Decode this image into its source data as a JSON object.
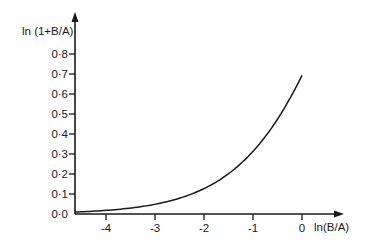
{
  "chart_data": {
    "type": "line",
    "title": "",
    "xlabel": "ln(B/A)",
    "ylabel": "ln (1+B/A)",
    "xlim": [
      -4.63,
      0.8
    ],
    "ylim": [
      0.0,
      0.9
    ],
    "grid": false,
    "legend": null,
    "x_ticks": [
      -4,
      -3,
      -2,
      -1,
      0
    ],
    "x_tick_labels": [
      "-4",
      "-3",
      "-2",
      "-1",
      "0"
    ],
    "y_ticks": [
      0.0,
      0.1,
      0.2,
      0.3,
      0.4,
      0.5,
      0.6,
      0.7,
      0.8
    ],
    "y_tick_labels": [
      "0·0",
      "0·1",
      "0·2",
      "0·3",
      "0·4",
      "0·5",
      "0·6",
      "0·7",
      "0·8"
    ],
    "series": [
      {
        "name": "ln(1+B/A) vs ln(B/A)",
        "x": [
          -4.63,
          -4.5,
          -4.0,
          -3.5,
          -3.0,
          -2.5,
          -2.0,
          -1.5,
          -1.0,
          -0.75,
          -0.5,
          -0.25,
          0.0
        ],
        "values": [
          0.01,
          0.011,
          0.018,
          0.03,
          0.049,
          0.079,
          0.127,
          0.201,
          0.313,
          0.386,
          0.474,
          0.576,
          0.693
        ]
      }
    ]
  },
  "axes": {
    "x_axis_label": "ln(B/A)",
    "y_axis_label": "ln (1+B/A)"
  }
}
